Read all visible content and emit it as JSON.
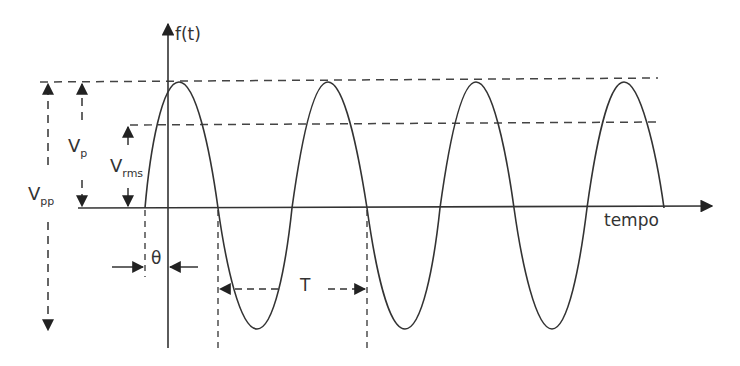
{
  "diagram": {
    "type": "sinusoidal-waveform",
    "colors": {
      "stroke": "#333333",
      "background": "#ffffff"
    },
    "axes": {
      "y_label": "f(t)",
      "x_label": "tempo"
    },
    "annotations": {
      "peak_to_peak": {
        "main": "V",
        "sub": "pp"
      },
      "peak": {
        "main": "V",
        "sub": "p"
      },
      "rms": {
        "main": "V",
        "sub": "rms"
      },
      "phase": "θ",
      "period": "T"
    },
    "wave": {
      "cycles_visible": 3.5,
      "peak_x": [
        179,
        328,
        476,
        624
      ],
      "trough_x": [
        257,
        405,
        552
      ],
      "zero_y": 208,
      "peak_y": 82,
      "trough_y": 329,
      "rms_y": 125
    }
  }
}
